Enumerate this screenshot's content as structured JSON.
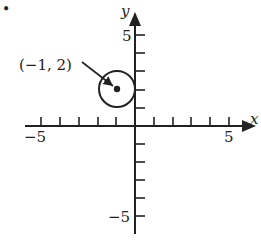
{
  "bullet": "•",
  "axes": {
    "x_label": "x",
    "y_label": "y",
    "x_min_label": "−5",
    "x_max_label": "5",
    "y_max_label": "5",
    "y_min_label": "−5",
    "range": [
      -5,
      5
    ]
  },
  "circle": {
    "center": [
      -1,
      2
    ],
    "radius": 1,
    "annotation": "(−1, 2)"
  },
  "colors": {
    "ink": "#222222",
    "background": "#ffffff"
  }
}
